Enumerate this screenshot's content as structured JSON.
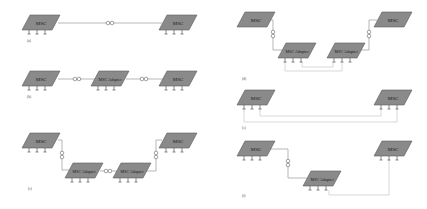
{
  "diagram": {
    "colors": {
      "node_fill": "#8a8a8a",
      "node_stroke": "#5a5a5a",
      "link": "#9a9a9a",
      "bus": "#c8c8c8",
      "background": "#ffffff"
    },
    "panels": [
      {
        "id": "a",
        "label": "(a)",
        "nodes": [
          {
            "id": "a1",
            "text": "MSC",
            "type": "msc",
            "x": 25,
            "y": 15,
            "legs": true
          },
          {
            "id": "a2",
            "text": "MSC",
            "type": "msc",
            "x": 160,
            "y": 15,
            "legs": true
          }
        ],
        "links": [
          {
            "from": "a1",
            "to": "a2",
            "style": "wireless"
          }
        ]
      },
      {
        "id": "b",
        "label": "(b)",
        "nodes": [
          {
            "id": "b1",
            "text": "MSC",
            "type": "msc",
            "x": 25,
            "y": 70,
            "legs": true
          },
          {
            "id": "b2",
            "text": "MSC Adapter",
            "type": "adapter",
            "x": 92,
            "y": 70,
            "legs": true
          },
          {
            "id": "b3",
            "text": "MSC",
            "type": "msc",
            "x": 160,
            "y": 70,
            "legs": true
          }
        ],
        "links": [
          {
            "from": "b1",
            "to": "b2",
            "style": "wireless"
          },
          {
            "from": "b2",
            "to": "b3",
            "style": "wireless"
          }
        ]
      },
      {
        "id": "c",
        "label": "(c)",
        "nodes": [
          {
            "id": "c1",
            "text": "MSC",
            "type": "msc",
            "x": 25,
            "y": 133,
            "legs": true
          },
          {
            "id": "c2",
            "text": "MSC Adapter",
            "type": "adapter",
            "x": 65,
            "y": 163,
            "legs": true
          },
          {
            "id": "c3",
            "text": "MSC Adapter",
            "type": "adapter",
            "x": 113,
            "y": 163,
            "legs": true
          },
          {
            "id": "c4",
            "text": "MSC",
            "type": "msc",
            "x": 160,
            "y": 133,
            "legs": true
          }
        ],
        "links": [
          {
            "from": "c1",
            "to": "c2",
            "style": "wireless-vertical"
          },
          {
            "from": "c2",
            "to": "c3",
            "style": "wireless"
          },
          {
            "from": "c4",
            "to": "c3",
            "style": "wireless-vertical"
          }
        ]
      },
      {
        "id": "d",
        "label": "(d)",
        "nodes": [
          {
            "id": "d1",
            "text": "MSC",
            "type": "msc",
            "x": 240,
            "y": 12,
            "legs": false
          },
          {
            "id": "d2",
            "text": "MSC Adapter",
            "type": "adapter",
            "x": 278,
            "y": 43,
            "legs": true
          },
          {
            "id": "d3",
            "text": "MSC Adapter",
            "type": "adapter",
            "x": 327,
            "y": 43,
            "legs": true
          },
          {
            "id": "d4",
            "text": "MSC",
            "type": "msc",
            "x": 375,
            "y": 12,
            "legs": false
          }
        ],
        "links": [
          {
            "from": "d1",
            "to": "d2",
            "style": "wireless-vertical"
          },
          {
            "from": "d4",
            "to": "d3",
            "style": "wireless-vertical"
          },
          {
            "from": "d2",
            "to": "d3",
            "style": "bus"
          }
        ]
      },
      {
        "id": "e",
        "label": "(e)",
        "nodes": [
          {
            "id": "e1",
            "text": "MSC",
            "type": "msc",
            "x": 240,
            "y": 90,
            "legs": true
          },
          {
            "id": "e2",
            "text": "MSC",
            "type": "msc",
            "x": 375,
            "y": 90,
            "legs": true
          }
        ],
        "links": [
          {
            "from": "e1",
            "to": "e2",
            "style": "bus"
          }
        ]
      },
      {
        "id": "f",
        "label": "(f)",
        "nodes": [
          {
            "id": "f1",
            "text": "MSC",
            "type": "msc",
            "x": 240,
            "y": 141,
            "legs": true
          },
          {
            "id": "f2",
            "text": "MSC Adapter",
            "type": "adapter",
            "x": 303,
            "y": 171,
            "legs": true
          },
          {
            "id": "f3",
            "text": "MSC",
            "type": "msc",
            "x": 375,
            "y": 141,
            "legs": true
          }
        ],
        "links": [
          {
            "from": "f1",
            "to": "f2",
            "style": "wireless-vertical"
          },
          {
            "from": "f2",
            "to": "f3",
            "style": "bus"
          }
        ]
      }
    ]
  }
}
